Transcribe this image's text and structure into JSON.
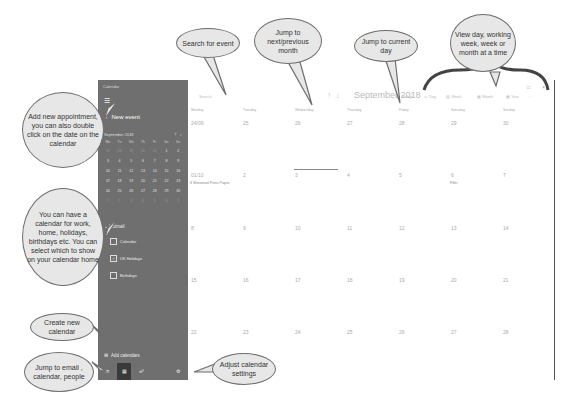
{
  "sidebar": {
    "app_title": "Calendar",
    "new_event_label": "New event",
    "mini_calendar": {
      "month_label": "September 2018",
      "weekdays": [
        "Mo",
        "Tu",
        "We",
        "Th",
        "Fr",
        "Sa",
        "Su"
      ],
      "days": [
        "27",
        "28",
        "29",
        "30",
        "31",
        "1",
        "2",
        "3",
        "4",
        "5",
        "6",
        "7",
        "8",
        "9",
        "10",
        "11",
        "12",
        "13",
        "14",
        "15",
        "16",
        "17",
        "18",
        "19",
        "20",
        "21",
        "22",
        "23",
        "24",
        "25",
        "26",
        "27",
        "28",
        "29",
        "30",
        "1",
        "2",
        "3",
        "4",
        "5",
        "6",
        "7"
      ]
    },
    "account_label": "Hotmail",
    "calendars": [
      {
        "label": "Calendar",
        "checked": false
      },
      {
        "label": "UK Holidays",
        "checked": true
      },
      {
        "label": "Birthdays",
        "checked": false
      }
    ],
    "add_calendars_label": "Add calendars"
  },
  "toolbar": {
    "search_placeholder": "Search",
    "month_title": "September 2018",
    "today_label": "Today",
    "day_label": "Day",
    "week_label": "Week",
    "month_label": "Month",
    "year_label": "Year",
    "more_label": "···"
  },
  "grid": {
    "weekdays": [
      "Monday",
      "Tuesday",
      "Wednesday",
      "Thursday",
      "Friday",
      "Saturday",
      "Sunday"
    ],
    "weeks": [
      [
        "24/09",
        "25",
        "26",
        "27",
        "28",
        "29",
        "30"
      ],
      [
        "01/10",
        "2",
        "3",
        "4",
        "5",
        "6",
        "7"
      ],
      [
        "8",
        "9",
        "10",
        "11",
        "12",
        "13",
        "14"
      ],
      [
        "15",
        "16",
        "17",
        "18",
        "19",
        "20",
        "21"
      ],
      [
        "22",
        "23",
        "24",
        "25",
        "26",
        "27",
        "28"
      ]
    ],
    "events": {
      "week1_mon": "8 Sherwood Press Payne",
      "week1_sat": "Filler"
    }
  },
  "callouts": {
    "search": "Search for event",
    "nav": "Jump to next/previous month",
    "today": "Jump to current day",
    "views": "View day, working week, week or month at a time",
    "new_event": "Add new appointment, you can also double click on the date on the calendar",
    "calendars": "You can have a calendar for work, home, holidays, birthdays etc. You can select which to show on your calendar home",
    "create_calendar": "Create new calendar",
    "jump_apps": "Jump to email , calendar, people",
    "settings": "Adjust calendar settings"
  }
}
